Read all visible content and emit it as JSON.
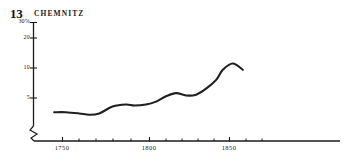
{
  "figure": {
    "number": "13",
    "title": "CHEMNITZ"
  },
  "chart_data": {
    "type": "line",
    "title": "CHEMNITZ",
    "xlabel": "",
    "ylabel": "",
    "yscale": "log",
    "grid": false,
    "legend": null,
    "axis_break": true,
    "xlim": [
      1730,
      1880
    ],
    "ylim": [
      3,
      33
    ],
    "ytick_labels": [
      "30%",
      "20",
      "10",
      "5"
    ],
    "ytick_values": [
      30,
      20,
      10,
      5
    ],
    "xtick_labels": [
      "1750",
      "1800",
      "1850"
    ],
    "xtick_values": [
      1750,
      1800,
      1850
    ],
    "xminor_ticks": [
      1760,
      1770,
      1780,
      1790,
      1810,
      1820,
      1830,
      1840,
      1860,
      1870
    ],
    "series": [
      {
        "name": "Chemnitz",
        "x": [
          1745,
          1752,
          1760,
          1766,
          1772,
          1780,
          1788,
          1793,
          1800,
          1806,
          1812,
          1818,
          1824,
          1830,
          1836,
          1842,
          1846,
          1852,
          1858
        ],
        "values": [
          3.6,
          3.6,
          3.5,
          3.4,
          3.5,
          4.1,
          4.3,
          4.2,
          4.3,
          4.6,
          5.2,
          5.6,
          5.3,
          5.4,
          6.2,
          7.6,
          9.6,
          11.1,
          9.6
        ]
      }
    ]
  }
}
